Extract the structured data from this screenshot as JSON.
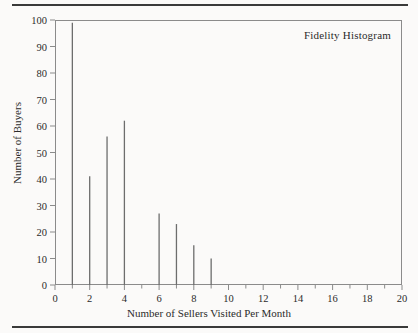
{
  "chart_data": {
    "type": "bar",
    "title": "Fidelity Histogram",
    "xlabel": "Number of Sellers Visited Per Month",
    "ylabel": "Number of Buyers",
    "categories": [
      0,
      1,
      2,
      3,
      4,
      5,
      6,
      7,
      8,
      9,
      10,
      11,
      12,
      13,
      14,
      15,
      16,
      17,
      18,
      19,
      20
    ],
    "values": [
      0,
      99,
      41,
      56,
      62,
      0,
      27,
      23,
      15,
      10,
      0,
      0,
      0,
      0,
      0,
      0,
      0,
      0,
      0,
      0,
      0
    ],
    "xlim": [
      0,
      20
    ],
    "ylim": [
      0,
      100
    ],
    "x_major_ticks": [
      0,
      2,
      4,
      6,
      8,
      10,
      12,
      14,
      16,
      18,
      20
    ],
    "x_minor_ticks": [
      1,
      3,
      5,
      7,
      9,
      11,
      13,
      15,
      17,
      19
    ],
    "y_ticks": [
      0,
      10,
      20,
      30,
      40,
      50,
      60,
      70,
      80,
      90,
      100
    ],
    "x_tick_labels": [
      "0",
      "2",
      "4",
      "6",
      "8",
      "10",
      "12",
      "14",
      "16",
      "18",
      "20"
    ],
    "y_tick_labels": [
      "0",
      "10",
      "20",
      "30",
      "40",
      "50",
      "60",
      "70",
      "80",
      "90",
      "100"
    ],
    "grid": false,
    "legend": false,
    "bar_color": "#6d6d6d",
    "axis_color": "#8b8b8b",
    "text_color": "#2b2b2b",
    "background": "#fbfaf9",
    "rule_color": "#3a3a3a"
  }
}
